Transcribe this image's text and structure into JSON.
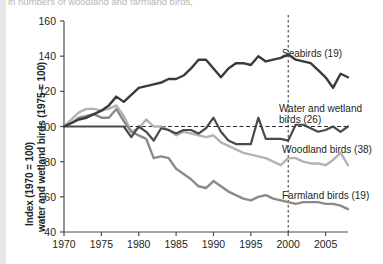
{
  "caption": {
    "clipped_line": "in numbers of woodland and farmland birds,"
  },
  "chart_data": {
    "type": "line",
    "title": "",
    "subtitle": "",
    "xlabel": "",
    "ylabel_line1": "Index (1970 = 100)",
    "ylabel_line2": "water and wetland birds (1975 = 100)",
    "xlim": [
      1970,
      2008
    ],
    "ylim": [
      40,
      160
    ],
    "yticks": [
      40,
      60,
      80,
      100,
      120,
      140,
      160
    ],
    "xticks": [
      1970,
      1975,
      1980,
      1985,
      1990,
      1995,
      2000,
      2005
    ],
    "grid": false,
    "legend_position": "inline-right-annotations",
    "reference_lines": [
      {
        "name": "index-baseline",
        "orientation": "horizontal",
        "value": 100,
        "style": "dashed"
      },
      {
        "name": "year-2000-marker",
        "orientation": "vertical",
        "value": 2000,
        "style": "dashed"
      }
    ],
    "x": [
      1970,
      1971,
      1972,
      1973,
      1974,
      1975,
      1976,
      1977,
      1978,
      1979,
      1980,
      1981,
      1982,
      1983,
      1984,
      1985,
      1986,
      1987,
      1988,
      1989,
      1990,
      1991,
      1992,
      1993,
      1994,
      1995,
      1996,
      1997,
      1998,
      1999,
      2000,
      2001,
      2002,
      2003,
      2004,
      2005,
      2006,
      2007,
      2008
    ],
    "series": [
      {
        "name": "Seabirds (19)",
        "label": "Seabirds (19)",
        "color": "#3a3a3a",
        "width": 2.4,
        "values": [
          100,
          102,
          104,
          105,
          107,
          109,
          112,
          117,
          114,
          118,
          122,
          123,
          124,
          125,
          127,
          127,
          129,
          133,
          138,
          138,
          133,
          128,
          133,
          136,
          136,
          135,
          140,
          137,
          138,
          139,
          141,
          138,
          137,
          136,
          132,
          128,
          122,
          130,
          128
        ]
      },
      {
        "name": "Water and wetland birds (26)",
        "label": "Water and wetland birds (26)",
        "color": "#4a4a4a",
        "width": 2.2,
        "values": [
          100,
          100,
          100,
          100,
          100,
          100,
          100,
          100,
          100,
          94,
          100,
          97,
          92,
          99,
          98,
          96,
          98,
          98,
          96,
          99,
          105,
          97,
          92,
          90,
          90,
          90,
          105,
          93,
          93,
          93,
          92,
          101,
          101,
          99,
          97,
          98,
          100,
          97,
          100
        ]
      },
      {
        "name": "Woodland birds (38)",
        "label": "Woodland birds (38)",
        "color": "#b3b3b3",
        "width": 2.4,
        "values": [
          100,
          104,
          108,
          110,
          110,
          109,
          110,
          112,
          106,
          97,
          99,
          104,
          100,
          100,
          98,
          95,
          97,
          96,
          95,
          94,
          95,
          91,
          89,
          87,
          85,
          84,
          83,
          82,
          80,
          78,
          82,
          82,
          80,
          79,
          79,
          78,
          81,
          85,
          78
        ]
      },
      {
        "name": "Farmland birds (19)",
        "label": "Farmland birds (19)",
        "color": "#8a8a8a",
        "width": 2.4,
        "values": [
          100,
          102,
          105,
          106,
          107,
          105,
          105,
          110,
          103,
          97,
          95,
          93,
          82,
          83,
          82,
          76,
          73,
          70,
          66,
          65,
          69,
          66,
          63,
          61,
          59,
          58,
          60,
          61,
          59,
          58,
          57,
          56,
          57,
          57,
          57,
          56,
          56,
          55,
          53
        ]
      }
    ],
    "annotations": [
      {
        "name": "seabirds-label",
        "text": "Seabirds (19)",
        "x_px": 282,
        "y_px": 48
      },
      {
        "name": "water-wetland-label-line1",
        "text": "Water and wetland",
        "x_px": 279,
        "y_px": 103
      },
      {
        "name": "water-wetland-label-line2",
        "text": "birds (26)",
        "x_px": 279,
        "y_px": 114
      },
      {
        "name": "woodland-label",
        "text": "Woodland birds (38)",
        "x_px": 282,
        "y_px": 144
      },
      {
        "name": "farmland-label",
        "text": "Farmland birds (19)",
        "x_px": 282,
        "y_px": 190
      }
    ]
  },
  "axes": {
    "y_tick_labels": [
      "160",
      "140",
      "120",
      "100",
      "80",
      "60",
      "40"
    ],
    "x_tick_labels": [
      "1970",
      "1975",
      "1980",
      "1985",
      "1990",
      "1995",
      "2000",
      "2005"
    ]
  },
  "colors": {
    "axis": "#4d4d4d",
    "text": "#231f20",
    "background": "#ffffff",
    "gutter": "#e6e6e6",
    "seabirds": "#3a3a3a",
    "water": "#4a4a4a",
    "woodland": "#b3b3b3",
    "farmland": "#8a8a8a"
  }
}
